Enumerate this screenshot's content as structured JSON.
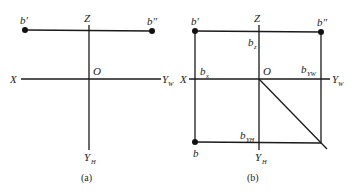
{
  "figure_a": {
    "caption": "(a)",
    "labels": {
      "b_prime": "b′",
      "b_dprime": "b″",
      "Z": "Z",
      "X": "X",
      "O": "O",
      "Y_W": "Y",
      "Y_W_sub": "W",
      "Y_H": "Y",
      "Y_H_sub": "H"
    }
  },
  "figure_b": {
    "caption": "(b)",
    "labels": {
      "b_prime": "b′",
      "b_dprime": "b″",
      "Z": "Z",
      "X": "X",
      "O": "O",
      "b_z": "b",
      "b_z_sub": "z",
      "b_x": "b",
      "b_x_sub": "x",
      "b_yw": "b",
      "b_yw_sub": "YW",
      "b_yh": "b",
      "b_yh_sub": "YH",
      "b": "b",
      "Y_W": "Y",
      "Y_W_sub": "W",
      "Y_H": "Y",
      "Y_H_sub": "H"
    }
  },
  "colors": {
    "line": "#1a1a1a",
    "text": "#222222"
  }
}
